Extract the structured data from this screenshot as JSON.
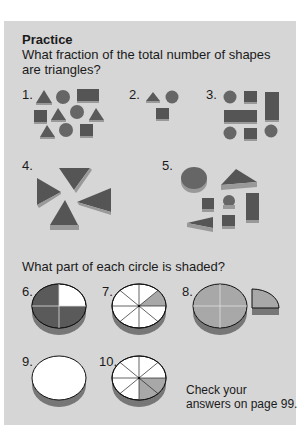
{
  "heading": "Practice",
  "question1": "What fraction of the total number of shapes are triangles?",
  "question2": "What part of each circle is shaded?",
  "problems": [
    {
      "label": "1.",
      "shapes": {
        "triangles": 4,
        "circles": 3,
        "squares": 3,
        "rectangles": 1
      }
    },
    {
      "label": "2.",
      "shapes": {
        "triangles": 1,
        "circles": 1,
        "squares": 1
      }
    },
    {
      "label": "3.",
      "shapes": {
        "circles": 3,
        "squares": 2,
        "rectangles": 2
      }
    },
    {
      "label": "4.",
      "shapes": {
        "triangles": 4
      }
    },
    {
      "label": "5.",
      "shapes": {
        "circles": 2,
        "triangles": 2,
        "squares": 2,
        "rectangles": 1
      }
    },
    {
      "label": "6.",
      "circle": {
        "parts": 4,
        "shaded": 3
      }
    },
    {
      "label": "7.",
      "circle": {
        "parts": 8,
        "shaded": 1
      }
    },
    {
      "label": "8.",
      "circle": {
        "parts": 4,
        "shaded": 4
      }
    },
    {
      "label": "9.",
      "circle": {
        "parts": 1,
        "shaded": 0
      }
    },
    {
      "label": "10.",
      "circle": {
        "parts": 8,
        "shaded": 2
      }
    }
  ],
  "footer": {
    "line1": "Check your",
    "line2": "answers on page 99."
  },
  "colors": {
    "panel": "#d6d6d6",
    "shape_dark": "#555555",
    "shape_shadow": "#8a8a8a",
    "circle_shade": "#9e9e9e",
    "white": "#ffffff"
  }
}
